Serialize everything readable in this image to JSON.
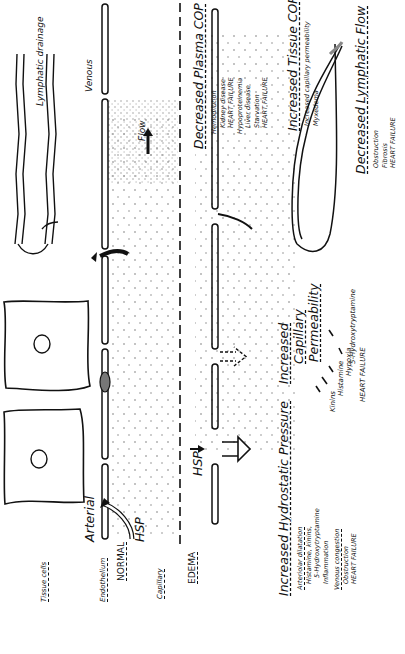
{
  "orientation": "rotated-90-ccw",
  "normal_panel": {
    "label_tissue_cells": "Tissue cells",
    "label_endothelium": "Endothelium",
    "label_normal": "NORMAL",
    "label_capillary": "Capillary",
    "label_arterial": "Arterial",
    "label_hsp": "HSP",
    "label_venous": "Venous",
    "label_flow": "Flow",
    "label_lymphatic": "Lymphatic drainage"
  },
  "edema_panel": {
    "label_edema": "EDEMA",
    "label_hsp": "HSP",
    "hydrostatic": {
      "title": "Increased Hydrostatic Pressure",
      "items": [
        {
          "text": "Arteriolar dilatation",
          "underline": true
        },
        {
          "text": "Histamine, kinins,",
          "indent": 1
        },
        {
          "text": "5-Hydroxytryptamine",
          "indent": 2
        },
        {
          "text": "Inflammation",
          "indent": 1
        },
        {
          "text": "Venous congestion",
          "underline": true
        },
        {
          "text": "Obstruction",
          "indent": 1
        },
        {
          "text": "HEART FAILURE",
          "indent": 1
        }
      ]
    },
    "permeability": {
      "title_lines": [
        "Increased",
        "Capillary",
        "Permeability"
      ],
      "causes": [
        "Kinins",
        "Histamine",
        "Hypoxia",
        "5-Hydroxytryptamine"
      ],
      "heart_failure": "HEART FAILURE"
    },
    "plasma_cop": {
      "title": "Decreased Plasma COP",
      "items": [
        {
          "text": "Hemodilution",
          "indent": 0
        },
        {
          "text": "Kidney disease",
          "indent": 1
        },
        {
          "text": "HEART FAILURE",
          "indent": 1
        },
        {
          "text": "Hypoproteinemia",
          "indent": 0
        },
        {
          "text": "Liver disease",
          "indent": 1
        },
        {
          "text": "Starvation",
          "indent": 1
        },
        {
          "text": "HEART FAILURE",
          "indent": 1
        }
      ]
    },
    "tissue_cop": {
      "title": "Increased Tissue COP",
      "items": [
        {
          "text": "Increased capillary permeability",
          "indent": 0
        },
        {
          "text": "Myxedema",
          "indent": 0
        }
      ]
    },
    "lymphatic_flow": {
      "title": "Decreased Lymphatic Flow",
      "items": [
        {
          "text": "Obstruction",
          "indent": 0
        },
        {
          "text": "Fibrosis",
          "indent": 0
        },
        {
          "text": "HEART FAILURE",
          "indent": 0
        }
      ]
    }
  },
  "colors": {
    "ink": "#111111",
    "background": "#ffffff",
    "stipple": "#555555"
  }
}
